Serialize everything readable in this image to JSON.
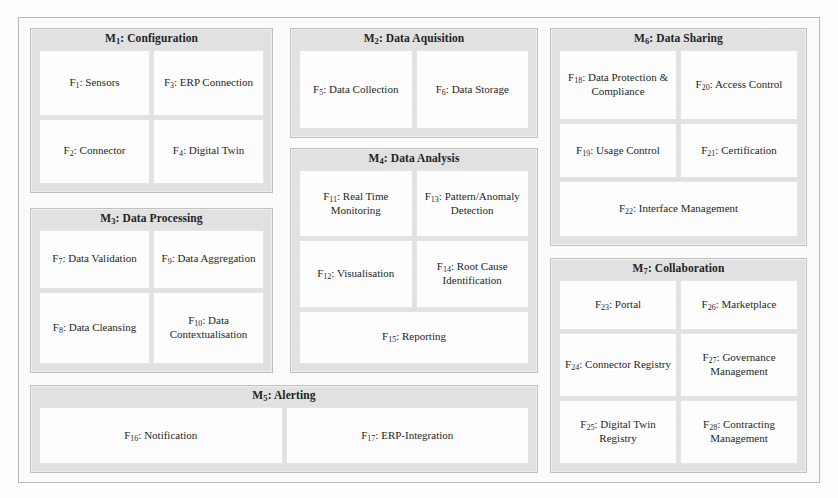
{
  "diagram": {
    "colors": {
      "module_background": "#e3e3e3",
      "module_border": "#c2c2c2",
      "function_background": "#ffffff",
      "function_border": "#e6e6e6",
      "page_background": "#ffffff",
      "text": "#1f1f1f"
    }
  },
  "modules": [
    {
      "id": "m1",
      "code": "M",
      "code_sub": "1",
      "title": "M₁: Configuration",
      "name": "Configuration",
      "rows": [
        [
          {
            "code": "F",
            "code_sub": "1",
            "label": "F₁: Sensors",
            "name": "Sensors"
          },
          {
            "code": "F",
            "code_sub": "3",
            "label": "F₃: ERP Connection",
            "name": "ERP Connection"
          }
        ],
        [
          {
            "code": "F",
            "code_sub": "2",
            "label": "F₂: Connector",
            "name": "Connector"
          },
          {
            "code": "F",
            "code_sub": "4",
            "label": "F₄: Digital Twin",
            "name": "Digital Twin"
          }
        ]
      ]
    },
    {
      "id": "m3",
      "code": "M",
      "code_sub": "3",
      "title": "M₃: Data Processing",
      "name": "Data Processing",
      "rows": [
        [
          {
            "code": "F",
            "code_sub": "7",
            "label": "F₇: Data Validation",
            "name": "Data Validation"
          },
          {
            "code": "F",
            "code_sub": "9",
            "label": "F₉: Data Aggregation",
            "name": "Data Aggregation"
          }
        ],
        [
          {
            "code": "F",
            "code_sub": "8",
            "label": "F₈: Data Cleansing",
            "name": "Data Cleansing"
          },
          {
            "code": "F",
            "code_sub": "10",
            "label": "F₁₀: Data Contextualisation",
            "name": "Data Contextualisation"
          }
        ]
      ]
    },
    {
      "id": "m2",
      "code": "M",
      "code_sub": "2",
      "title": "M₂: Data Aquisition",
      "name": "Data Aquisition",
      "rows": [
        [
          {
            "code": "F",
            "code_sub": "5",
            "label": "F₅: Data Collection",
            "name": "Data Collection"
          },
          {
            "code": "F",
            "code_sub": "6",
            "label": "F₆: Data Storage",
            "name": "Data Storage"
          }
        ]
      ]
    },
    {
      "id": "m4",
      "code": "M",
      "code_sub": "4",
      "title": "M₄: Data Analysis",
      "name": "Data Analysis",
      "rows": [
        [
          {
            "code": "F",
            "code_sub": "11",
            "label": "F₁₁: Real Time Monitoring",
            "name": "Real Time Monitoring"
          },
          {
            "code": "F",
            "code_sub": "13",
            "label": "F₁₃: Pattern/Anomaly Detection",
            "name": "Pattern/Anomaly Detection"
          }
        ],
        [
          {
            "code": "F",
            "code_sub": "12",
            "label": "F₁₂: Visualisation",
            "name": "Visualisation"
          },
          {
            "code": "F",
            "code_sub": "14",
            "label": "F₁₄: Root Cause Identification",
            "name": "Root Cause Identification"
          }
        ],
        [
          {
            "code": "F",
            "code_sub": "15",
            "label": "F₁₅: Reporting",
            "name": "Reporting"
          }
        ]
      ]
    },
    {
      "id": "m6",
      "code": "M",
      "code_sub": "6",
      "title": "M₆: Data Sharing",
      "name": "Data Sharing",
      "rows": [
        [
          {
            "code": "F",
            "code_sub": "18",
            "label": "F₁₈: Data Protection & Compliance",
            "name": "Data Protection & Compliance"
          },
          {
            "code": "F",
            "code_sub": "20",
            "label": "F₂₀: Access Control",
            "name": "Access Control"
          }
        ],
        [
          {
            "code": "F",
            "code_sub": "19",
            "label": "F₁₉: Usage Control",
            "name": "Usage Control"
          },
          {
            "code": "F",
            "code_sub": "21",
            "label": "F₂₁: Certification",
            "name": "Certification"
          }
        ],
        [
          {
            "code": "F",
            "code_sub": "22",
            "label": "F₂₂: Interface Management",
            "name": "Interface Management"
          }
        ]
      ]
    },
    {
      "id": "m7",
      "code": "M",
      "code_sub": "7",
      "title": "M₇: Collaboration",
      "name": "Collaboration",
      "rows": [
        [
          {
            "code": "F",
            "code_sub": "23",
            "label": "F₂₃: Portal",
            "name": "Portal"
          },
          {
            "code": "F",
            "code_sub": "26",
            "label": "F₂₆: Marketplace",
            "name": "Marketplace"
          }
        ],
        [
          {
            "code": "F",
            "code_sub": "24",
            "label": "F₂₄: Connector Registry",
            "name": "Connector Registry"
          },
          {
            "code": "F",
            "code_sub": "27",
            "label": "F₂₇: Governance Management",
            "name": "Governance Management"
          }
        ],
        [
          {
            "code": "F",
            "code_sub": "25",
            "label": "F₂₅: Digital Twin Registry",
            "name": "Digital Twin Registry"
          },
          {
            "code": "F",
            "code_sub": "28",
            "label": "F₂₈: Contracting Management",
            "name": "Contracting Management"
          }
        ]
      ]
    },
    {
      "id": "m5",
      "code": "M",
      "code_sub": "5",
      "title": "M₅: Alerting",
      "name": "Alerting",
      "rows": [
        [
          {
            "code": "F",
            "code_sub": "16",
            "label": "F₁₆: Notification",
            "name": "Notification"
          },
          {
            "code": "F",
            "code_sub": "17",
            "label": "F₁₇: ERP-Integration",
            "name": "ERP-Integration"
          }
        ]
      ]
    }
  ]
}
